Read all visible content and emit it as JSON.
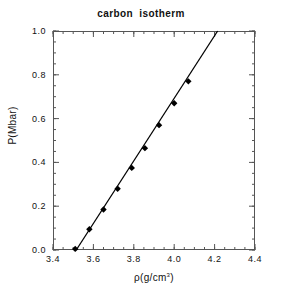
{
  "chart_data": {
    "type": "scatter",
    "title": "carbon  isotherm",
    "xlabel": "ρ(g/cm3)",
    "xlabel_base": "ρ(g/cm",
    "xlabel_sup": "3",
    "xlabel_close": ")",
    "ylabel": "P(Mbar)",
    "xlim": [
      3.4,
      4.4
    ],
    "ylim": [
      0.0,
      1.0
    ],
    "xticks": [
      3.4,
      3.6,
      3.8,
      4.0,
      4.2,
      4.4
    ],
    "xtick_labels": [
      "3.4",
      "3.6",
      "3.8",
      "4.0",
      "4.2",
      "4.4"
    ],
    "yticks": [
      0.0,
      0.2,
      0.4,
      0.6,
      0.8,
      1.0
    ],
    "ytick_labels": [
      "0.0",
      "0.2",
      "0.4",
      "0.6",
      "0.8",
      "1.0"
    ],
    "x_minor_interval": 0.05,
    "y_minor_interval": 0.05,
    "grid": false,
    "legend": null,
    "marker": "filled-diamond",
    "marker_color": "#000000",
    "line_color": "#000000",
    "frame_color": "#555555",
    "background": "#ffffff",
    "series": [
      {
        "name": "data",
        "kind": "scatter",
        "x": [
          3.51,
          3.58,
          3.65,
          3.72,
          3.79,
          3.855,
          3.925,
          4.0,
          4.07
        ],
        "y": [
          0.005,
          0.095,
          0.185,
          0.28,
          0.375,
          0.465,
          0.57,
          0.67,
          0.77
        ]
      },
      {
        "name": "fit",
        "kind": "line",
        "x": [
          3.515,
          4.215
        ],
        "y": [
          0.0,
          1.0
        ]
      }
    ]
  }
}
